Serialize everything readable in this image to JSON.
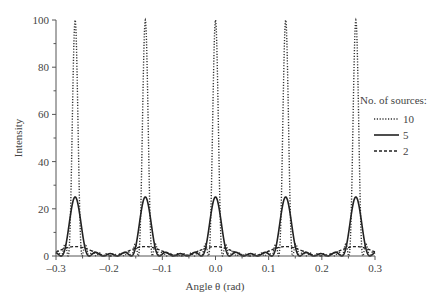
{
  "chart_data": {
    "type": "line",
    "title": "",
    "xlabel": "Angle θ (rad)",
    "ylabel": "Intensity",
    "xlim": [
      -0.3,
      0.3
    ],
    "ylim": [
      0,
      100
    ],
    "grid": false,
    "x_ticks": [
      -0.3,
      -0.2,
      -0.1,
      0.0,
      0.1,
      0.2,
      0.3
    ],
    "x_tick_labels": [
      "–0.3",
      "–0.2",
      "–0.1",
      "0.0",
      "0.1",
      "0.2",
      "0.3"
    ],
    "y_ticks": [
      0,
      20,
      40,
      60,
      80,
      100
    ],
    "y_tick_labels": [
      "0",
      "20",
      "40",
      "60",
      "80",
      "100"
    ],
    "principal_maxima_theta": [
      -0.264,
      -0.132,
      0.0,
      0.132,
      0.264
    ],
    "legend": {
      "title": "No. of sources:",
      "position": "right",
      "entries": [
        {
          "label": "10",
          "style": "dotted"
        },
        {
          "label": "5",
          "style": "solid"
        },
        {
          "label": "2",
          "style": "dashed"
        }
      ]
    },
    "series": [
      {
        "name": "10",
        "style": "dotted",
        "n_sources": 10,
        "peak_intensity": 100,
        "x": [
          -0.3,
          -0.264,
          -0.198,
          -0.132,
          -0.066,
          0.0,
          0.066,
          0.132,
          0.198,
          0.264,
          0.3
        ],
        "values": [
          0.9,
          100,
          0.0,
          100,
          0.0,
          100,
          0.0,
          100,
          0.0,
          100,
          0.9
        ]
      },
      {
        "name": "5",
        "style": "solid",
        "n_sources": 5,
        "peak_intensity": 25,
        "x": [
          -0.3,
          -0.264,
          -0.198,
          -0.132,
          -0.066,
          0.0,
          0.066,
          0.132,
          0.198,
          0.264,
          0.3
        ],
        "values": [
          1.6,
          25,
          1.0,
          25,
          1.0,
          25,
          1.0,
          25,
          1.0,
          25,
          1.6
        ]
      },
      {
        "name": "2",
        "style": "dashed",
        "n_sources": 2,
        "peak_intensity": 4,
        "x": [
          -0.3,
          -0.264,
          -0.198,
          -0.132,
          -0.066,
          0.0,
          0.066,
          0.132,
          0.198,
          0.264,
          0.3
        ],
        "values": [
          1.9,
          4,
          0,
          4,
          0,
          4,
          0,
          4,
          0,
          4,
          1.9
        ]
      }
    ]
  }
}
